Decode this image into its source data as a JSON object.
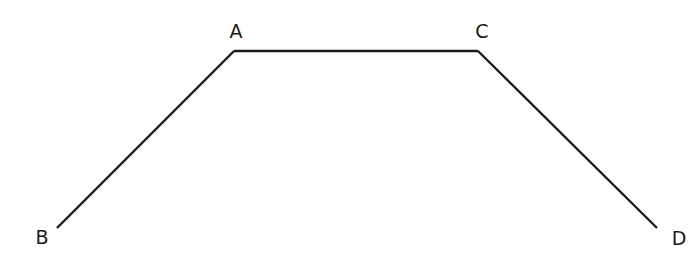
{
  "diagram": {
    "type": "polyline",
    "points": [
      {
        "id": "B",
        "label": "B"
      },
      {
        "id": "A",
        "label": "A"
      },
      {
        "id": "C",
        "label": "C"
      },
      {
        "id": "D",
        "label": "D"
      }
    ],
    "segments": [
      {
        "from": "B",
        "to": "A"
      },
      {
        "from": "A",
        "to": "C"
      },
      {
        "from": "C",
        "to": "D"
      }
    ],
    "line_color": "#1a1a1a",
    "background_color": "#ffffff"
  }
}
